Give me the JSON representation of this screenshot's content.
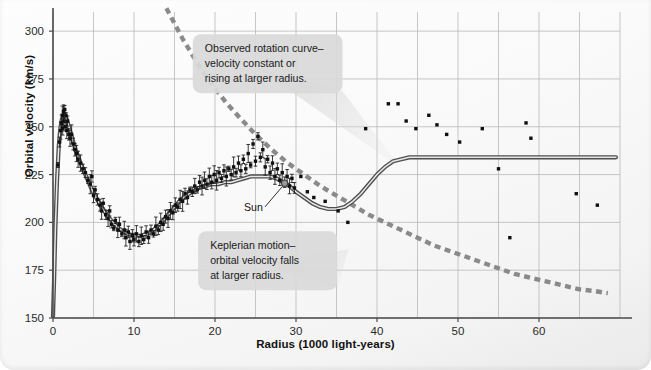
{
  "chart_data": {
    "type": "scatter",
    "title": "",
    "xlabel": "Radius (1000 light-years)",
    "ylabel": "Orbital velocity (km/s)",
    "xlim": [
      0,
      70
    ],
    "ylim": [
      150,
      310
    ],
    "xticks": [
      0,
      10,
      20,
      30,
      40,
      50,
      60
    ],
    "yticks": [
      150,
      175,
      200,
      225,
      250,
      275,
      300
    ],
    "xtick_labels": [
      "0",
      "10",
      "20",
      "30",
      "40",
      "50",
      "60"
    ],
    "ytick_labels": [
      "150",
      "175",
      "200",
      "225",
      "250",
      "275",
      "300"
    ],
    "x_minor_step": 5,
    "y_minor_step": 25,
    "grid": true,
    "legend_position": "none",
    "annotations": [
      {
        "name": "observed-rotation-callout",
        "lines": [
          "Observed rotation curve–",
          "velocity constant or",
          "rising at larger radius."
        ],
        "x": 26.5,
        "y": 283
      },
      {
        "name": "keplerian-callout",
        "lines": [
          "Keplerian motion–",
          "orbital velocity falls",
          "at larger radius."
        ],
        "x": 26.5,
        "y": 180
      },
      {
        "name": "sun-marker-label",
        "lines": [
          "Sun"
        ],
        "x": 25.8,
        "y": 206,
        "marker_x": 28.6,
        "marker_y": 220.5
      }
    ],
    "series": [
      {
        "name": "Observed rotation curve (model)",
        "type": "line",
        "style": "solid",
        "color": "#6b6b6b",
        "points": [
          [
            0.0,
            151
          ],
          [
            0.15,
            172
          ],
          [
            0.3,
            198
          ],
          [
            0.5,
            222
          ],
          [
            0.7,
            239
          ],
          [
            0.9,
            249
          ],
          [
            1.1,
            254
          ],
          [
            1.35,
            256
          ],
          [
            1.6,
            255
          ],
          [
            1.9,
            251
          ],
          [
            2.3,
            245
          ],
          [
            2.8,
            238
          ],
          [
            3.4,
            231
          ],
          [
            4.0,
            225
          ],
          [
            4.6,
            219
          ],
          [
            5.3,
            213
          ],
          [
            6.0,
            208
          ],
          [
            6.8,
            203
          ],
          [
            7.6,
            199
          ],
          [
            8.4,
            196
          ],
          [
            9.2,
            194
          ],
          [
            10.0,
            193
          ],
          [
            10.8,
            193
          ],
          [
            11.6,
            194
          ],
          [
            12.4,
            196
          ],
          [
            13.2,
            199
          ],
          [
            14.0,
            203
          ],
          [
            14.8,
            207
          ],
          [
            15.6,
            211
          ],
          [
            16.4,
            214
          ],
          [
            17.2,
            216
          ],
          [
            18.0,
            218
          ],
          [
            18.8,
            219
          ],
          [
            19.6,
            220
          ],
          [
            20.4,
            220
          ],
          [
            21.2,
            221
          ],
          [
            22.0,
            221
          ],
          [
            22.8,
            222
          ],
          [
            23.6,
            223
          ],
          [
            24.4,
            224
          ],
          [
            25.2,
            224
          ],
          [
            26.0,
            224
          ],
          [
            26.8,
            224
          ],
          [
            27.6,
            223
          ],
          [
            28.4,
            221
          ],
          [
            29.2,
            219
          ],
          [
            30.0,
            216
          ],
          [
            31.0,
            213
          ],
          [
            32.0,
            210
          ],
          [
            33.0,
            208
          ],
          [
            34.0,
            207
          ],
          [
            35.0,
            207
          ],
          [
            36.0,
            208
          ],
          [
            37.0,
            211
          ],
          [
            38.0,
            215
          ],
          [
            39.0,
            220
          ],
          [
            40.0,
            225
          ],
          [
            41.0,
            229
          ],
          [
            42.0,
            232
          ],
          [
            43.0,
            233
          ],
          [
            44.0,
            234
          ],
          [
            46.0,
            234
          ],
          [
            50.0,
            234
          ],
          [
            55.0,
            234
          ],
          [
            60.0,
            234
          ],
          [
            65.0,
            234
          ],
          [
            69.5,
            234
          ]
        ]
      },
      {
        "name": "Keplerian motion prediction",
        "type": "line",
        "style": "dashed",
        "color": "#8a8a8a",
        "points": [
          [
            14.0,
            312
          ],
          [
            15.0,
            304
          ],
          [
            16.0,
            296
          ],
          [
            17.0,
            289
          ],
          [
            18.0,
            282
          ],
          [
            19.0,
            276
          ],
          [
            20.0,
            270
          ],
          [
            21.5,
            262
          ],
          [
            23.0,
            255
          ],
          [
            25.0,
            246
          ],
          [
            27.0,
            238
          ],
          [
            29.0,
            231
          ],
          [
            31.0,
            225
          ],
          [
            33.0,
            219
          ],
          [
            35.0,
            214
          ],
          [
            37.0,
            209
          ],
          [
            39.0,
            204
          ],
          [
            41.0,
            200
          ],
          [
            43.0,
            196
          ],
          [
            45.0,
            192
          ],
          [
            47.0,
            188
          ],
          [
            49.0,
            185
          ],
          [
            51.0,
            182
          ],
          [
            53.0,
            179
          ],
          [
            55.0,
            176
          ],
          [
            57.0,
            173
          ],
          [
            59.0,
            171
          ],
          [
            61.0,
            169
          ],
          [
            63.0,
            167
          ],
          [
            65.0,
            165
          ],
          [
            67.0,
            164
          ],
          [
            68.5,
            163
          ]
        ]
      },
      {
        "name": "Inner disk measurements",
        "type": "scatter",
        "color": "#101010",
        "points": [
          [
            0.6,
            230
          ],
          [
            0.8,
            242
          ],
          [
            0.95,
            248
          ],
          [
            1.05,
            252
          ],
          [
            1.15,
            256
          ],
          [
            1.2,
            249
          ],
          [
            1.3,
            258
          ],
          [
            1.35,
            253
          ],
          [
            1.45,
            259
          ],
          [
            1.5,
            250
          ],
          [
            1.6,
            256
          ],
          [
            1.7,
            248
          ],
          [
            1.8,
            253
          ],
          [
            1.95,
            246
          ],
          [
            2.1,
            244
          ],
          [
            2.3,
            246
          ],
          [
            2.5,
            241
          ],
          [
            2.7,
            238
          ],
          [
            2.9,
            236
          ],
          [
            3.1,
            233
          ],
          [
            3.4,
            231
          ],
          [
            3.7,
            228
          ],
          [
            4.0,
            226
          ],
          [
            4.3,
            222
          ],
          [
            4.6,
            220
          ],
          [
            4.8,
            224
          ],
          [
            5.0,
            214
          ],
          [
            5.2,
            217
          ],
          [
            5.5,
            212
          ],
          [
            5.8,
            209
          ],
          [
            6.0,
            206
          ],
          [
            6.2,
            210
          ],
          [
            6.5,
            204
          ],
          [
            6.8,
            202
          ],
          [
            7.0,
            206
          ],
          [
            7.2,
            199
          ],
          [
            7.5,
            197
          ],
          [
            7.7,
            201
          ],
          [
            8.0,
            196
          ],
          [
            8.2,
            199
          ],
          [
            8.5,
            194
          ],
          [
            8.8,
            196
          ],
          [
            9.0,
            192
          ],
          [
            9.3,
            195
          ],
          [
            9.5,
            190
          ],
          [
            9.8,
            193
          ],
          [
            10.0,
            191
          ],
          [
            10.3,
            194
          ],
          [
            10.6,
            190
          ],
          [
            10.9,
            193
          ],
          [
            11.2,
            191
          ],
          [
            11.5,
            195
          ],
          [
            11.8,
            192
          ],
          [
            12.1,
            196
          ],
          [
            12.4,
            194
          ],
          [
            12.7,
            198
          ],
          [
            13.0,
            196
          ],
          [
            13.3,
            200
          ],
          [
            13.6,
            199
          ],
          [
            13.9,
            203
          ],
          [
            14.2,
            202
          ],
          [
            14.5,
            206
          ],
          [
            14.8,
            205
          ],
          [
            15.1,
            209
          ],
          [
            15.4,
            208
          ],
          [
            15.7,
            212
          ],
          [
            16.0,
            211
          ],
          [
            16.3,
            215
          ],
          [
            16.6,
            213
          ],
          [
            16.9,
            217
          ],
          [
            17.2,
            216
          ],
          [
            17.5,
            219
          ],
          [
            17.8,
            217
          ],
          [
            18.1,
            221
          ],
          [
            18.4,
            219
          ],
          [
            18.7,
            222
          ],
          [
            19.0,
            220
          ],
          [
            19.3,
            224
          ],
          [
            19.6,
            221
          ],
          [
            19.9,
            225
          ],
          [
            20.2,
            222
          ],
          [
            20.5,
            226
          ],
          [
            20.8,
            223
          ],
          [
            21.1,
            227
          ],
          [
            21.4,
            224
          ],
          [
            21.7,
            228
          ],
          [
            22.0,
            225
          ],
          [
            22.3,
            229
          ],
          [
            22.6,
            226
          ],
          [
            22.9,
            231
          ],
          [
            23.2,
            227
          ],
          [
            23.5,
            233
          ],
          [
            23.8,
            228
          ],
          [
            24.1,
            236
          ],
          [
            24.4,
            230
          ],
          [
            24.7,
            241
          ],
          [
            25.0,
            232
          ],
          [
            25.3,
            245
          ],
          [
            25.6,
            234
          ],
          [
            25.9,
            238
          ],
          [
            26.2,
            229
          ],
          [
            26.5,
            233
          ],
          [
            26.8,
            226
          ],
          [
            27.1,
            231
          ],
          [
            27.4,
            224
          ],
          [
            27.7,
            228
          ],
          [
            28.0,
            222
          ],
          [
            28.3,
            226
          ],
          [
            28.6,
            221
          ],
          [
            28.9,
            224
          ],
          [
            29.2,
            219
          ],
          [
            29.5,
            223
          ],
          [
            29.8,
            218
          ]
        ]
      },
      {
        "name": "Outer halo measurements",
        "type": "scatter",
        "color": "#101010",
        "points": [
          [
            30.6,
            224
          ],
          [
            31.4,
            216
          ],
          [
            32.2,
            213
          ],
          [
            33.6,
            211
          ],
          [
            35.2,
            206
          ],
          [
            36.4,
            200
          ],
          [
            38.6,
            249
          ],
          [
            41.4,
            262
          ],
          [
            42.6,
            262
          ],
          [
            43.6,
            253
          ],
          [
            44.8,
            249
          ],
          [
            46.4,
            256
          ],
          [
            47.4,
            251
          ],
          [
            48.6,
            246
          ],
          [
            50.2,
            242
          ],
          [
            53.0,
            249
          ],
          [
            55.0,
            228
          ],
          [
            56.4,
            192
          ],
          [
            58.4,
            252
          ],
          [
            59.0,
            244
          ],
          [
            64.6,
            215
          ],
          [
            67.2,
            209
          ]
        ]
      }
    ]
  },
  "axis": {
    "xlabel": "Radius (1000 light-years)",
    "ylabel": "Orbital velocity (km/s)"
  }
}
